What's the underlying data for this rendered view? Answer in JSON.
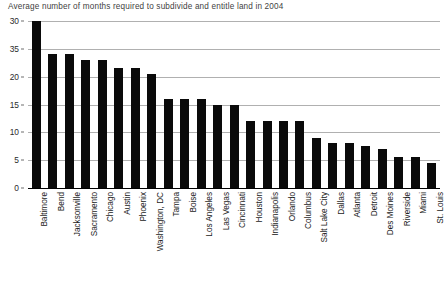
{
  "chart_data": {
    "type": "bar",
    "title": "Average number of months required to subdivide and entitle land in 2004",
    "xlabel": "",
    "ylabel": "",
    "ylim": [
      0,
      30
    ],
    "grid": true,
    "legend": null,
    "y_ticks": [
      {
        "label": "30",
        "value": 30
      },
      {
        "label": "35",
        "value": 25
      },
      {
        "label": "20",
        "value": 20
      },
      {
        "label": "15",
        "value": 15
      },
      {
        "label": "10",
        "value": 10
      },
      {
        "label": "5",
        "value": 5
      },
      {
        "label": "0",
        "value": 0
      }
    ],
    "categories": [
      "Baltimore",
      "Bend",
      "Jacksonville",
      "Sacramento",
      "Chicago",
      "Austin",
      "Phoenix",
      "Washington, DC",
      "Tampa",
      "Boise",
      "Los Angeles",
      "Las Vegas",
      "Cincinnati",
      "Houston",
      "Indianapolis",
      "Orlando",
      "Columbus",
      "Salt Lake City",
      "Dallas",
      "Atlanta",
      "Detroit",
      "Des Moines",
      "Riverside",
      "Miami",
      "St. Louis"
    ],
    "values": [
      30,
      24,
      24,
      23,
      23,
      21.5,
      21.5,
      20.5,
      16,
      16,
      16,
      15,
      15,
      12,
      12,
      12,
      12,
      9,
      8,
      8,
      7.5,
      7,
      5.5,
      5.5,
      4.5
    ],
    "bar_color": "#0a0a0a",
    "gridline_color": "#b0b0b0",
    "background_color": "#ffffff"
  }
}
